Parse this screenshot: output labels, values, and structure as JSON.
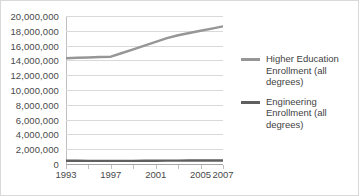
{
  "chart_data": {
    "type": "line",
    "title": "",
    "xlabel": "",
    "ylabel": "",
    "x": [
      1993,
      1994,
      1995,
      1996,
      1997,
      1998,
      1999,
      2000,
      2001,
      2002,
      2003,
      2004,
      2005,
      2006,
      2007
    ],
    "x_tick_labels": [
      "1993",
      "1997",
      "2001",
      "2005",
      "2007"
    ],
    "x_tick_values": [
      1993,
      1997,
      2001,
      2005,
      2007
    ],
    "xlim": [
      1993,
      2007
    ],
    "ylim": [
      0,
      20000000
    ],
    "y_tick_labels": [
      "20,000,000",
      "18,000,000",
      "16,000,000",
      "14,000,000",
      "12,000,000",
      "10,000,000",
      "8,000,000",
      "6,000,000",
      "4,000,000",
      "2,000,000",
      "0"
    ],
    "y_tick_values": [
      20000000,
      18000000,
      16000000,
      14000000,
      12000000,
      10000000,
      8000000,
      6000000,
      4000000,
      2000000,
      0
    ],
    "grid": true,
    "legend_position": "right",
    "series": [
      {
        "name": "Higher Education Enrollment (all degrees)",
        "color": "#969696",
        "values": [
          14300000,
          14350000,
          14400000,
          14450000,
          14500000,
          15000000,
          15500000,
          16000000,
          16500000,
          17000000,
          17400000,
          17700000,
          18000000,
          18300000,
          18600000
        ]
      },
      {
        "name": "Engineering Enrollment (all degrees)",
        "color": "#5f5f5f",
        "values": [
          430000,
          430000,
          425000,
          420000,
          420000,
          420000,
          425000,
          430000,
          440000,
          450000,
          460000,
          465000,
          470000,
          475000,
          480000
        ]
      }
    ]
  },
  "legend": {
    "entries": [
      {
        "label": "Higher Education Enrollment (all degrees)",
        "color": "#969696"
      },
      {
        "label": "Engineering Enrollment (all degrees)",
        "color": "#5f5f5f"
      }
    ]
  },
  "colors": {
    "gridline": "#d9d9d9",
    "axis": "#a6a6a6",
    "tick_label": "#4a4a4a",
    "border": "#d9d9d9",
    "background": "#ffffff"
  }
}
